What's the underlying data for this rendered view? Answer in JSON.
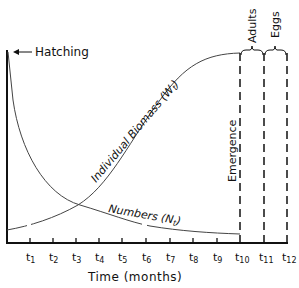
{
  "diagram": {
    "title": "",
    "x_axis": {
      "label": "Time (months)",
      "ticks": [
        "t1",
        "t2",
        "t3",
        "t4",
        "t5",
        "t6",
        "t7",
        "t8",
        "t9",
        "t10",
        "t11",
        "t12"
      ]
    },
    "annotations": {
      "hatching": "Hatching",
      "emergence": "Emergence",
      "adults": "Adults",
      "eggs": "Eggs"
    },
    "curves": {
      "biomass": {
        "label": "Individual Biomass (W",
        "sub": "t",
        "close": ")"
      },
      "numbers": {
        "label": "Numbers (N",
        "sub": "t",
        "close": ")"
      }
    },
    "colors": {
      "ink": "#111111",
      "curve": "#444444",
      "background": "#ffffff"
    }
  }
}
